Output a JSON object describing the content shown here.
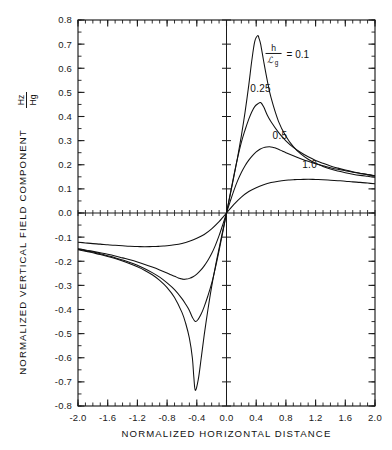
{
  "chart_data": {
    "type": "line",
    "title": "",
    "xlabel": "NORMALIZED HORIZONTAL DISTANCE",
    "ylabel": "NORMALIZED VERTICAL FIELD COMPONENT",
    "ylabel_symbol_num": "Hz",
    "ylabel_symbol_den": "Hg",
    "xlim": [
      -2.0,
      2.0
    ],
    "ylim": [
      -0.8,
      0.8
    ],
    "grid": false,
    "legend_position": "inside-upper-right",
    "xticks": [
      -2.0,
      -1.6,
      -1.2,
      -0.8,
      -0.4,
      0.0,
      0.4,
      0.8,
      1.2,
      1.6,
      2.0
    ],
    "xticklabels": [
      "-2.0",
      "-1.6",
      "-1.2",
      "-0.8",
      "-0.4",
      "0.0",
      "0.4",
      "0.8",
      "1.2",
      "1.6",
      "2.0"
    ],
    "yticks": [
      0.8,
      0.7,
      0.6,
      0.5,
      0.4,
      0.3,
      0.2,
      0.1,
      0.0,
      -0.1,
      -0.2,
      -0.3,
      -0.4,
      -0.5,
      -0.6,
      -0.7,
      -0.8
    ],
    "yticklabels": [
      "0.8",
      "0.7",
      "0.6",
      "0.5",
      "0.4",
      "0.3",
      "0.2",
      "0.1",
      "0.0",
      "-0.1",
      "-0.2",
      "-0.3",
      "-0.4",
      "-0.5",
      "-0.6",
      "-0.7",
      "-0.8"
    ],
    "x_minor_tick_step": 0.1,
    "y_minor_tick_step": 0.05,
    "annotations": [
      {
        "name": "legend-ratio",
        "text": "= 0.1",
        "x": 0.93,
        "y": 0.655
      },
      {
        "name": "curve-label-025",
        "text": "0.25",
        "x": 0.46,
        "y": 0.5
      },
      {
        "name": "curve-label-05",
        "text": "0.5",
        "x": 0.72,
        "y": 0.305
      },
      {
        "name": "curve-label-10",
        "text": "1.0",
        "x": 1.12,
        "y": 0.185
      }
    ],
    "series": [
      {
        "name": "0.1",
        "label": "h/Lg = 0.1",
        "color": "#111111",
        "peak_x": 0.42,
        "peak_y": 0.735,
        "trough_x": -0.44,
        "trough_y": -0.735,
        "x": [
          -2.0,
          -1.9,
          -1.8,
          -1.7,
          -1.6,
          -1.5,
          -1.4,
          -1.3,
          -1.2,
          -1.1,
          -1.0,
          -0.9,
          -0.8,
          -0.7,
          -0.6,
          -0.55,
          -0.5,
          -0.46,
          -0.44,
          -0.42,
          -0.38,
          -0.34,
          -0.3,
          -0.25,
          -0.2,
          -0.15,
          -0.1,
          -0.05,
          0.0,
          0.05,
          0.1,
          0.15,
          0.2,
          0.25,
          0.3,
          0.34,
          0.38,
          0.42,
          0.44,
          0.46,
          0.5,
          0.55,
          0.6,
          0.7,
          0.8,
          0.9,
          1.0,
          1.1,
          1.2,
          1.3,
          1.4,
          1.5,
          1.6,
          1.7,
          1.8,
          1.9,
          2.0
        ],
        "y": [
          -0.152,
          -0.158,
          -0.165,
          -0.172,
          -0.18,
          -0.189,
          -0.199,
          -0.21,
          -0.223,
          -0.238,
          -0.256,
          -0.279,
          -0.309,
          -0.35,
          -0.412,
          -0.457,
          -0.519,
          -0.6,
          -0.68,
          -0.735,
          -0.69,
          -0.6,
          -0.505,
          -0.4,
          -0.305,
          -0.222,
          -0.147,
          -0.073,
          0.0,
          0.075,
          0.152,
          0.232,
          0.32,
          0.418,
          0.53,
          0.63,
          0.71,
          0.735,
          0.722,
          0.7,
          0.63,
          0.548,
          0.478,
          0.38,
          0.318,
          0.275,
          0.245,
          0.223,
          0.206,
          0.193,
          0.182,
          0.174,
          0.167,
          0.161,
          0.156,
          0.152,
          0.148
        ]
      },
      {
        "name": "0.25",
        "label": "h/Lg = 0.25",
        "color": "#111111",
        "peak_x": 0.46,
        "peak_y": 0.458,
        "trough_x": -0.46,
        "trough_y": -0.458,
        "x": [
          -2.0,
          -1.9,
          -1.8,
          -1.7,
          -1.6,
          -1.5,
          -1.4,
          -1.3,
          -1.2,
          -1.1,
          -1.0,
          -0.9,
          -0.8,
          -0.7,
          -0.6,
          -0.55,
          -0.5,
          -0.46,
          -0.42,
          -0.38,
          -0.34,
          -0.3,
          -0.25,
          -0.2,
          -0.15,
          -0.1,
          -0.05,
          0.0,
          0.05,
          0.1,
          0.15,
          0.2,
          0.25,
          0.3,
          0.34,
          0.38,
          0.42,
          0.46,
          0.5,
          0.55,
          0.6,
          0.7,
          0.8,
          0.9,
          1.0,
          1.1,
          1.2,
          1.3,
          1.4,
          1.5,
          1.6,
          1.7,
          1.8,
          1.9,
          2.0
        ],
        "y": [
          -0.15,
          -0.156,
          -0.162,
          -0.169,
          -0.177,
          -0.185,
          -0.195,
          -0.205,
          -0.217,
          -0.231,
          -0.247,
          -0.266,
          -0.29,
          -0.318,
          -0.355,
          -0.378,
          -0.404,
          -0.432,
          -0.45,
          -0.44,
          -0.418,
          -0.388,
          -0.343,
          -0.292,
          -0.228,
          -0.156,
          -0.079,
          0.0,
          0.079,
          0.157,
          0.229,
          0.293,
          0.344,
          0.389,
          0.419,
          0.441,
          0.452,
          0.458,
          0.44,
          0.405,
          0.378,
          0.334,
          0.299,
          0.272,
          0.251,
          0.233,
          0.218,
          0.206,
          0.195,
          0.186,
          0.178,
          0.171,
          0.165,
          0.159,
          0.154
        ]
      },
      {
        "name": "0.5",
        "label": "h/Lg = 0.5",
        "color": "#111111",
        "peak_x": 0.62,
        "peak_y": 0.275,
        "trough_x": -0.62,
        "trough_y": -0.275,
        "x": [
          -2.0,
          -1.9,
          -1.8,
          -1.7,
          -1.6,
          -1.5,
          -1.4,
          -1.3,
          -1.2,
          -1.1,
          -1.0,
          -0.9,
          -0.8,
          -0.75,
          -0.7,
          -0.65,
          -0.62,
          -0.58,
          -0.54,
          -0.5,
          -0.45,
          -0.4,
          -0.35,
          -0.3,
          -0.25,
          -0.2,
          -0.15,
          -0.1,
          -0.05,
          0.0,
          0.05,
          0.1,
          0.15,
          0.2,
          0.25,
          0.3,
          0.35,
          0.4,
          0.45,
          0.5,
          0.54,
          0.58,
          0.62,
          0.65,
          0.7,
          0.75,
          0.8,
          0.9,
          1.0,
          1.1,
          1.2,
          1.3,
          1.4,
          1.5,
          1.6,
          1.7,
          1.8,
          1.9,
          2.0
        ],
        "y": [
          -0.148,
          -0.153,
          -0.159,
          -0.165,
          -0.171,
          -0.178,
          -0.186,
          -0.194,
          -0.203,
          -0.213,
          -0.224,
          -0.236,
          -0.249,
          -0.256,
          -0.262,
          -0.269,
          -0.272,
          -0.275,
          -0.274,
          -0.271,
          -0.264,
          -0.253,
          -0.238,
          -0.219,
          -0.196,
          -0.168,
          -0.134,
          -0.094,
          -0.048,
          0.0,
          0.048,
          0.094,
          0.134,
          0.168,
          0.196,
          0.219,
          0.238,
          0.253,
          0.264,
          0.271,
          0.274,
          0.275,
          0.273,
          0.27,
          0.264,
          0.257,
          0.25,
          0.237,
          0.225,
          0.214,
          0.204,
          0.196,
          0.188,
          0.181,
          0.175,
          0.169,
          0.164,
          0.159,
          0.155
        ]
      },
      {
        "name": "1.0",
        "label": "h/Lg = 1.0",
        "color": "#111111",
        "peak_x": 1.0,
        "peak_y": 0.139,
        "trough_x": -1.0,
        "trough_y": -0.139,
        "x": [
          -2.0,
          -1.9,
          -1.8,
          -1.7,
          -1.6,
          -1.5,
          -1.4,
          -1.3,
          -1.2,
          -1.1,
          -1.0,
          -0.95,
          -0.9,
          -0.85,
          -0.8,
          -0.7,
          -0.6,
          -0.5,
          -0.4,
          -0.3,
          -0.2,
          -0.1,
          -0.05,
          0.0,
          0.05,
          0.1,
          0.2,
          0.3,
          0.4,
          0.5,
          0.6,
          0.7,
          0.8,
          0.85,
          0.9,
          0.95,
          1.0,
          1.1,
          1.2,
          1.3,
          1.4,
          1.5,
          1.6,
          1.7,
          1.8,
          1.9,
          2.0
        ],
        "y": [
          -0.121,
          -0.124,
          -0.127,
          -0.129,
          -0.132,
          -0.134,
          -0.136,
          -0.138,
          -0.139,
          -0.14,
          -0.139,
          -0.139,
          -0.138,
          -0.137,
          -0.136,
          -0.132,
          -0.126,
          -0.117,
          -0.105,
          -0.089,
          -0.066,
          -0.036,
          -0.018,
          0.0,
          0.018,
          0.036,
          0.066,
          0.089,
          0.105,
          0.117,
          0.126,
          0.132,
          0.136,
          0.137,
          0.138,
          0.139,
          0.139,
          0.14,
          0.139,
          0.138,
          0.136,
          0.134,
          0.132,
          0.129,
          0.127,
          0.124,
          0.121
        ]
      }
    ]
  }
}
